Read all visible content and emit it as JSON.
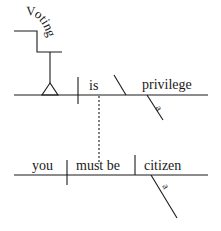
{
  "diagram": {
    "type": "sentence-diagram",
    "clause1": {
      "subject_phrase": "Voting",
      "verb": "is",
      "predicate_nominative": "privilege",
      "modifier": "a"
    },
    "clause2": {
      "subject": "you",
      "verb": "must be",
      "predicate_nominative": "citizen",
      "modifier": "a"
    }
  },
  "colors": {
    "ink": "#1a1a1a",
    "background": "#ffffff"
  }
}
